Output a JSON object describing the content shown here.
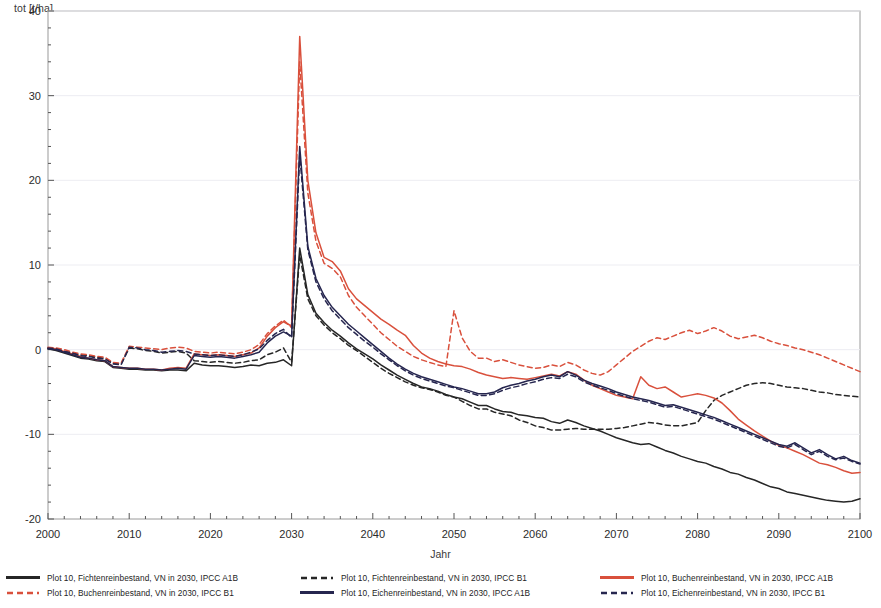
{
  "axes": {
    "ylabel": "tot [t/ha]",
    "xlabel": "Jahr",
    "yticks": [
      "40",
      "30",
      "20",
      "10",
      "0",
      "-10",
      "-20"
    ],
    "xticks": [
      "2000",
      "2010",
      "2020",
      "2030",
      "2040",
      "2050",
      "2060",
      "2070",
      "2080",
      "2090",
      "2100"
    ]
  },
  "legend": {
    "entries": [
      {
        "label": "Plot 10, Fichtenreinbestand, VN in 2030, IPCC A1B",
        "color": "#262626",
        "style": "solid",
        "col": 0,
        "row": 0
      },
      {
        "label": "Plot 10, Buchenreinbestand, VN in 2030, IPCC B1",
        "color": "#d9503c",
        "style": "dashed",
        "col": 0,
        "row": 1
      },
      {
        "label": "Plot 10, Fichtenreinbestand, VN in 2030, IPCC B1",
        "color": "#262626",
        "style": "dashed",
        "col": 1,
        "row": 0
      },
      {
        "label": "Plot 10, Eichenreinbestand, VN in 2030, IPCC A1B",
        "color": "#26264f",
        "style": "solid",
        "col": 1,
        "row": 1
      },
      {
        "label": "Plot 10, Buchenreinbestand, VN in 2030, IPCC A1B",
        "color": "#d9503c",
        "style": "solid",
        "col": 2,
        "row": 0
      },
      {
        "label": "Plot 10, Eichenreinbestand, VN in 2030, IPCC B1",
        "color": "#26264f",
        "style": "dashed",
        "col": 2,
        "row": 1
      }
    ]
  },
  "chart_data": {
    "type": "line",
    "title": "",
    "xlabel": "Jahr",
    "ylabel": "tot [t/ha]",
    "xlim": [
      2000,
      2100
    ],
    "ylim": [
      -20,
      40
    ],
    "grid": false,
    "legend_position": "bottom",
    "x": [
      2000,
      2001,
      2002,
      2003,
      2004,
      2005,
      2006,
      2007,
      2008,
      2009,
      2010,
      2011,
      2012,
      2013,
      2014,
      2015,
      2016,
      2017,
      2018,
      2019,
      2020,
      2021,
      2022,
      2023,
      2024,
      2025,
      2026,
      2027,
      2028,
      2029,
      2030,
      2031,
      2032,
      2033,
      2034,
      2035,
      2036,
      2037,
      2038,
      2039,
      2040,
      2041,
      2042,
      2043,
      2044,
      2045,
      2046,
      2047,
      2048,
      2049,
      2050,
      2051,
      2052,
      2053,
      2054,
      2055,
      2056,
      2057,
      2058,
      2059,
      2060,
      2061,
      2062,
      2063,
      2064,
      2065,
      2066,
      2067,
      2068,
      2069,
      2070,
      2071,
      2072,
      2073,
      2074,
      2075,
      2076,
      2077,
      2078,
      2079,
      2080,
      2081,
      2082,
      2083,
      2084,
      2085,
      2086,
      2087,
      2088,
      2089,
      2090,
      2091,
      2092,
      2093,
      2094,
      2095,
      2096,
      2097,
      2098,
      2099,
      2100
    ],
    "series": [
      {
        "name": "Plot 10, Fichtenreinbestand, VN in 2030, IPCC A1B",
        "color": "#262626",
        "style": "solid",
        "values": [
          0.1,
          -0.1,
          -0.4,
          -0.7,
          -1.0,
          -1.1,
          -1.3,
          -1.4,
          -2.1,
          -2.2,
          -2.3,
          -2.3,
          -2.4,
          -2.4,
          -2.5,
          -2.4,
          -2.4,
          -2.5,
          -1.6,
          -1.8,
          -1.9,
          -1.9,
          -2.0,
          -2.1,
          -2.0,
          -1.8,
          -1.9,
          -1.6,
          -1.5,
          -1.2,
          -1.9,
          12.0,
          6.5,
          4.3,
          3.2,
          2.3,
          1.6,
          0.8,
          0.1,
          -0.5,
          -1.1,
          -1.8,
          -2.4,
          -3.0,
          -3.5,
          -4.0,
          -4.4,
          -4.6,
          -4.9,
          -5.3,
          -5.6,
          -5.8,
          -6.2,
          -6.6,
          -6.6,
          -7.0,
          -7.3,
          -7.4,
          -7.7,
          -7.8,
          -8.0,
          -8.1,
          -8.5,
          -8.7,
          -8.3,
          -8.6,
          -9.0,
          -9.3,
          -9.6,
          -10.0,
          -10.4,
          -10.7,
          -11.0,
          -11.2,
          -11.1,
          -11.5,
          -11.9,
          -12.2,
          -12.6,
          -12.9,
          -13.2,
          -13.4,
          -13.8,
          -14.1,
          -14.5,
          -14.7,
          -15.1,
          -15.4,
          -15.8,
          -16.2,
          -16.4,
          -16.8,
          -17.0,
          -17.2,
          -17.4,
          -17.6,
          -17.8,
          -17.9,
          -18.0,
          -17.9,
          -17.6
        ]
      },
      {
        "name": "Plot 10, Fichtenreinbestand, VN in 2030, IPCC B1",
        "color": "#262626",
        "style": "dashed",
        "values": [
          0.2,
          0.1,
          -0.2,
          -0.4,
          -0.6,
          -0.7,
          -0.9,
          -1.0,
          -1.6,
          -1.7,
          0.2,
          0.1,
          -0.1,
          -0.2,
          -0.4,
          -0.3,
          -0.2,
          -0.4,
          -1.3,
          -1.4,
          -1.5,
          -1.4,
          -1.5,
          -1.6,
          -1.5,
          -1.3,
          -1.2,
          -0.6,
          -0.3,
          0.2,
          -1.5,
          11.2,
          6.0,
          4.0,
          2.9,
          2.0,
          1.3,
          0.5,
          -0.1,
          -0.8,
          -1.5,
          -2.2,
          -2.8,
          -3.3,
          -3.8,
          -4.2,
          -4.5,
          -4.7,
          -5.0,
          -5.4,
          -5.6,
          -6.1,
          -6.6,
          -7.0,
          -7.0,
          -7.4,
          -7.6,
          -7.8,
          -8.3,
          -8.6,
          -9.0,
          -9.2,
          -9.5,
          -9.5,
          -9.4,
          -9.3,
          -9.4,
          -9.4,
          -9.4,
          -9.4,
          -9.3,
          -9.2,
          -9.0,
          -8.8,
          -8.6,
          -8.7,
          -8.9,
          -9.0,
          -9.0,
          -8.8,
          -8.6,
          -7.2,
          -6.0,
          -5.4,
          -5.0,
          -4.6,
          -4.2,
          -4.0,
          -3.9,
          -4.0,
          -4.2,
          -4.4,
          -4.5,
          -4.6,
          -4.8,
          -5.0,
          -5.1,
          -5.3,
          -5.4,
          -5.5,
          -5.6
        ]
      },
      {
        "name": "Plot 10, Buchenreinbestand, VN in 2030, IPCC A1B",
        "color": "#d9503c",
        "style": "solid",
        "values": [
          0.2,
          0.1,
          -0.2,
          -0.5,
          -0.8,
          -1.0,
          -1.2,
          -1.3,
          -2.0,
          -2.1,
          -2.2,
          -2.2,
          -2.3,
          -2.3,
          -2.4,
          -2.2,
          -2.1,
          -2.2,
          -0.5,
          -0.6,
          -0.7,
          -0.6,
          -0.7,
          -0.8,
          -0.6,
          -0.4,
          0.2,
          1.6,
          2.6,
          3.3,
          2.8,
          37.0,
          20.0,
          13.8,
          10.9,
          10.4,
          9.3,
          7.2,
          6.0,
          5.2,
          4.4,
          3.6,
          3.0,
          2.3,
          1.7,
          0.5,
          -0.4,
          -1.0,
          -1.4,
          -1.7,
          -1.9,
          -2.0,
          -2.3,
          -2.7,
          -3.0,
          -3.2,
          -3.4,
          -3.3,
          -3.4,
          -3.5,
          -3.3,
          -3.1,
          -2.9,
          -3.1,
          -2.6,
          -2.9,
          -3.6,
          -4.2,
          -4.6,
          -5.0,
          -5.4,
          -5.6,
          -5.8,
          -3.2,
          -4.2,
          -4.6,
          -4.4,
          -5.0,
          -5.6,
          -5.4,
          -5.2,
          -5.4,
          -5.7,
          -6.3,
          -7.2,
          -8.2,
          -8.9,
          -9.6,
          -10.2,
          -10.8,
          -11.3,
          -11.6,
          -12.0,
          -12.4,
          -12.9,
          -13.4,
          -13.6,
          -13.9,
          -14.3,
          -14.6,
          -14.5
        ]
      },
      {
        "name": "Plot 10, Buchenreinbestand, VN in 2030, IPCC B1",
        "color": "#d9503c",
        "style": "dashed",
        "values": [
          0.3,
          0.2,
          0.0,
          -0.3,
          -0.5,
          -0.6,
          -0.8,
          -0.9,
          -1.5,
          -1.6,
          0.4,
          0.3,
          0.2,
          0.1,
          0.0,
          0.2,
          0.3,
          0.2,
          -0.2,
          -0.3,
          -0.4,
          -0.3,
          -0.4,
          -0.5,
          -0.3,
          0.0,
          0.6,
          1.9,
          2.8,
          3.5,
          2.6,
          34.0,
          18.5,
          12.8,
          10.2,
          9.6,
          8.6,
          6.4,
          5.0,
          4.0,
          3.0,
          2.0,
          1.2,
          0.4,
          -0.2,
          -0.8,
          -1.2,
          -1.5,
          -1.8,
          -2.0,
          4.6,
          1.4,
          -0.2,
          -1.0,
          -1.0,
          -1.4,
          -1.2,
          -1.5,
          -1.8,
          -2.0,
          -2.2,
          -2.1,
          -1.8,
          -2.0,
          -1.5,
          -1.8,
          -2.4,
          -2.8,
          -3.0,
          -2.6,
          -1.8,
          -1.0,
          -0.2,
          0.4,
          1.0,
          1.4,
          1.2,
          1.6,
          2.0,
          2.3,
          1.9,
          2.2,
          2.6,
          2.2,
          1.6,
          1.3,
          1.5,
          1.7,
          1.4,
          1.0,
          0.7,
          0.5,
          0.2,
          0.0,
          -0.3,
          -0.6,
          -1.0,
          -1.4,
          -1.8,
          -2.2,
          -2.6
        ]
      },
      {
        "name": "Plot 10, Eichenreinbestand, VN in 2030, IPCC A1B",
        "color": "#26264f",
        "style": "solid",
        "values": [
          0.1,
          0.0,
          -0.3,
          -0.6,
          -0.9,
          -1.0,
          -1.2,
          -1.3,
          -2.0,
          -2.1,
          -2.2,
          -2.2,
          -2.3,
          -2.3,
          -2.4,
          -2.3,
          -2.2,
          -2.3,
          -0.7,
          -0.8,
          -0.9,
          -0.8,
          -0.9,
          -1.0,
          -0.8,
          -0.6,
          -0.3,
          0.8,
          1.6,
          2.1,
          1.6,
          24.0,
          12.2,
          8.4,
          6.4,
          5.0,
          4.0,
          3.0,
          2.2,
          1.4,
          0.6,
          -0.2,
          -1.0,
          -1.7,
          -2.3,
          -2.8,
          -3.2,
          -3.5,
          -3.8,
          -4.1,
          -4.4,
          -4.6,
          -4.9,
          -5.2,
          -5.2,
          -5.0,
          -4.5,
          -4.2,
          -4.0,
          -3.7,
          -3.5,
          -3.2,
          -3.0,
          -3.2,
          -2.6,
          -3.0,
          -3.6,
          -4.0,
          -4.3,
          -4.6,
          -5.0,
          -5.3,
          -5.6,
          -5.8,
          -6.0,
          -6.3,
          -6.6,
          -6.5,
          -6.8,
          -7.1,
          -7.4,
          -7.7,
          -8.0,
          -8.4,
          -8.8,
          -9.2,
          -9.6,
          -10.0,
          -10.4,
          -10.8,
          -11.2,
          -11.4,
          -11.0,
          -11.6,
          -12.2,
          -11.8,
          -12.4,
          -12.9,
          -12.6,
          -13.1,
          -13.4
        ]
      },
      {
        "name": "Plot 10, Eichenreinbestand, VN in 2030, IPCC B1",
        "color": "#26264f",
        "style": "dashed",
        "values": [
          0.2,
          0.1,
          -0.2,
          -0.4,
          -0.7,
          -0.8,
          -1.0,
          -1.1,
          -1.7,
          -1.8,
          0.3,
          0.2,
          0.0,
          -0.1,
          -0.3,
          -0.2,
          -0.1,
          -0.2,
          -0.5,
          -0.6,
          -0.7,
          -0.6,
          -0.7,
          -0.8,
          -0.6,
          -0.3,
          0.1,
          1.1,
          1.9,
          2.4,
          1.4,
          23.0,
          11.8,
          8.0,
          6.0,
          4.6,
          3.6,
          2.6,
          1.8,
          1.0,
          0.3,
          -0.5,
          -1.2,
          -1.9,
          -2.5,
          -3.0,
          -3.4,
          -3.7,
          -4.0,
          -4.3,
          -4.5,
          -4.8,
          -5.1,
          -5.4,
          -5.4,
          -5.2,
          -4.8,
          -4.5,
          -4.3,
          -4.0,
          -3.8,
          -3.5,
          -3.3,
          -3.4,
          -2.9,
          -3.2,
          -3.8,
          -4.2,
          -4.5,
          -4.8,
          -5.2,
          -5.5,
          -5.8,
          -6.0,
          -6.2,
          -6.5,
          -6.8,
          -6.7,
          -7.0,
          -7.3,
          -7.6,
          -7.9,
          -8.2,
          -8.6,
          -9.0,
          -9.4,
          -9.8,
          -10.2,
          -10.6,
          -11.0,
          -11.4,
          -11.6,
          -11.2,
          -11.8,
          -12.4,
          -12.0,
          -12.6,
          -13.0,
          -12.8,
          -13.2,
          -13.5
        ]
      }
    ]
  }
}
